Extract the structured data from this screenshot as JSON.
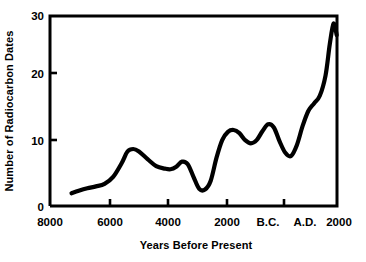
{
  "chart_data": {
    "type": "line",
    "title": "",
    "xlabel": "Years Before Present",
    "ylabel": "Number of Radiocarbon Dates",
    "xtick_labels": [
      "8000",
      "6000",
      "4000",
      "2000",
      "B.C.",
      "A.D.",
      "2000"
    ],
    "ytick_labels": [
      "0",
      "10",
      "20",
      "30"
    ],
    "ylim": [
      0,
      30
    ],
    "xlim": [
      8000,
      -2000
    ],
    "grid": false,
    "legend": null,
    "axis_direction_note": "x decreases left to right from 8000 BP to 0 (B.C./A.D. boundary) then to 2000 A.D.",
    "series": [
      {
        "name": "Radiocarbon dates",
        "x": [
          7250,
          7000,
          6700,
          6400,
          6100,
          5800,
          5500,
          5300,
          5100,
          4900,
          4600,
          4300,
          4000,
          3800,
          3600,
          3400,
          3200,
          3000,
          2800,
          2600,
          2400,
          2200,
          2000,
          1800,
          1600,
          1400,
          1200,
          1000,
          800,
          600,
          400,
          200,
          0,
          -200,
          -400,
          -600,
          -800,
          -1000,
          -1200,
          -1400,
          -1600,
          -1800
        ],
        "y": [
          2.0,
          2.4,
          2.8,
          3.1,
          3.5,
          4.6,
          6.8,
          8.6,
          9.0,
          8.6,
          7.4,
          6.3,
          5.9,
          5.8,
          6.2,
          7.0,
          6.6,
          4.6,
          2.7,
          2.6,
          4.0,
          7.6,
          10.4,
          11.7,
          12.0,
          11.5,
          10.4,
          9.9,
          10.4,
          11.8,
          12.9,
          12.4,
          10.2,
          8.4,
          7.9,
          9.6,
          12.6,
          15.0,
          16.2,
          17.0,
          18.6,
          20.5
        ]
      }
    ],
    "series_continued": {
      "x": [
        -1800,
        -1900,
        -1950,
        -1990
      ],
      "y": [
        20.5,
        25.0,
        28.6,
        27.0
      ]
    },
    "data_points_full": {
      "x": [
        7250,
        7000,
        6700,
        6400,
        6100,
        5800,
        5500,
        5300,
        5100,
        4900,
        4600,
        4300,
        4000,
        3800,
        3600,
        3400,
        3200,
        3000,
        2800,
        2600,
        2400,
        2200,
        2000,
        1800,
        1600,
        1400,
        1200,
        1000,
        800,
        600,
        400,
        200,
        0,
        -200,
        -400,
        -600,
        -800,
        -1000,
        -1200,
        -1400,
        -1600,
        -1750,
        -1880,
        -1990
      ],
      "y": [
        2.0,
        2.4,
        2.8,
        3.1,
        3.5,
        4.6,
        6.8,
        8.6,
        9.0,
        8.6,
        7.4,
        6.3,
        5.9,
        5.8,
        6.2,
        7.0,
        6.6,
        4.6,
        2.7,
        2.6,
        4.0,
        7.6,
        10.4,
        11.7,
        12.0,
        11.5,
        10.4,
        9.9,
        10.4,
        11.8,
        12.9,
        12.4,
        10.2,
        8.4,
        7.9,
        9.6,
        12.6,
        15.0,
        16.2,
        17.4,
        20.6,
        25.6,
        28.8,
        27.0
      ]
    }
  },
  "axes": {
    "y_title": "Number of Radiocarbon Dates",
    "x_title": "Years Before Present",
    "y_ticks": [
      {
        "label": "30",
        "value": 30
      },
      {
        "label": "20",
        "value": 20
      },
      {
        "label": "10",
        "value": 10
      },
      {
        "label": "0",
        "value": 0
      }
    ],
    "x_ticks": [
      {
        "label": "8000"
      },
      {
        "label": "6000"
      },
      {
        "label": "4000"
      },
      {
        "label": "2000"
      },
      {
        "label": "B.C."
      },
      {
        "label": "A.D."
      },
      {
        "label": "2000"
      }
    ]
  },
  "colors": {
    "line": "#000000",
    "axis": "#000000",
    "background": "#ffffff"
  }
}
